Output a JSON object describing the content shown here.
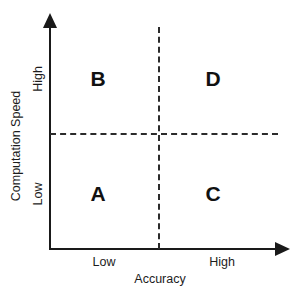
{
  "chart_data": {
    "type": "scatter",
    "title": "",
    "xlabel": "Accuracy",
    "ylabel": "Computation Speed",
    "x_ticks": [
      "Low",
      "High"
    ],
    "y_ticks": [
      "Low",
      "High"
    ],
    "grid": false,
    "legend": "none",
    "quadrant_divider": "dashed",
    "quadrants": [
      {
        "label": "A",
        "x": "Low",
        "y": "Low"
      },
      {
        "label": "B",
        "x": "Low",
        "y": "High"
      },
      {
        "label": "C",
        "x": "High",
        "y": "Low"
      },
      {
        "label": "D",
        "x": "High",
        "y": "High"
      }
    ]
  },
  "axes": {
    "x_title": "Accuracy",
    "y_title": "Computation Speed",
    "x_tick_low": "Low",
    "x_tick_high": "High",
    "y_tick_low": "Low",
    "y_tick_high": "High"
  },
  "quadrant_labels": {
    "top_left": "B",
    "top_right": "D",
    "bottom_left": "A",
    "bottom_right": "C"
  },
  "colors": {
    "axis": "#1a1a1a",
    "divider": "#2b2b2b",
    "text": "#1c1c1c",
    "background": "#ffffff"
  }
}
